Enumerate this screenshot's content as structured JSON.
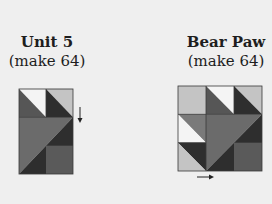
{
  "units": [
    {
      "title": "Unit 5",
      "subtitle": "(make 64)",
      "arrow": "down-arrow"
    },
    {
      "title": "Bear Paw",
      "subtitle": "(make 64)",
      "arrow": "right-arrow"
    }
  ],
  "colors": {
    "white": "#f4f4f4",
    "light": "#c4c4c4",
    "medium": "#6b6b6b",
    "mediumdark": "#565656",
    "dark": "#2e2e2e",
    "outline": "#3a3a3a",
    "arrow": "#222222"
  }
}
